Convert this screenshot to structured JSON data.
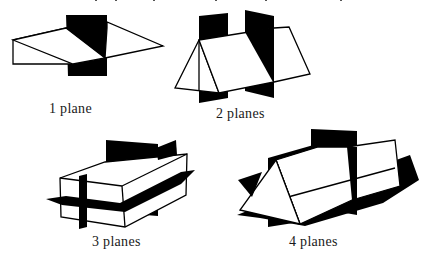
{
  "figures": [
    {
      "id": "one-plane",
      "label": "1 plane",
      "planes": 1,
      "shape": "triangular-prism"
    },
    {
      "id": "two-planes",
      "label": "2 planes",
      "planes": 2,
      "shape": "triangular-prism"
    },
    {
      "id": "three-planes",
      "label": "3 planes",
      "planes": 3,
      "shape": "rectangular-box"
    },
    {
      "id": "four-planes",
      "label": "4 planes",
      "planes": 4,
      "shape": "triangular-prism"
    }
  ],
  "colors": {
    "plane_fill": "#000000",
    "solid_stroke": "#000000",
    "background": "#ffffff"
  }
}
